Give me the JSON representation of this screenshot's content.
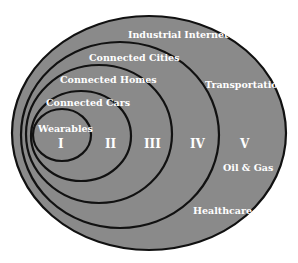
{
  "diagram": {
    "type": "nested-ellipses",
    "fill_color": "#8a8a8a",
    "stroke_color": "#111111",
    "label_color": "#ffffff",
    "rings": [
      {
        "level": "I",
        "label": "Wearables"
      },
      {
        "level": "II",
        "label": "Connected Cars"
      },
      {
        "level": "III",
        "label": "Connected Homes"
      },
      {
        "level": "IV",
        "label": "Connected Cities"
      },
      {
        "level": "V",
        "label": "Industrial Internet"
      }
    ],
    "outer_sectors": [
      "Transportation",
      "Oil & Gas",
      "Healthcare"
    ]
  }
}
